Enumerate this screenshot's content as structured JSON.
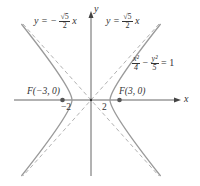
{
  "diagram": {
    "axes": {
      "x_label": "x",
      "y_label": "y"
    },
    "equation": {
      "lhs_term1_num": "x²",
      "lhs_term1_den": "4",
      "minus": "−",
      "lhs_term2_num": "y²",
      "lhs_term2_den": "5",
      "rhs": "= 1"
    },
    "asymptote_left": {
      "prefix": "y = −",
      "num": "√5",
      "den": "2",
      "suffix": "x"
    },
    "asymptote_right": {
      "prefix": "y =",
      "num": "√5",
      "den": "2",
      "suffix": "x"
    },
    "foci": [
      {
        "label": "F(−3, 0)",
        "x": -3,
        "y": 0
      },
      {
        "label": "F(3, 0)",
        "x": 3,
        "y": 0
      }
    ],
    "vertex_ticks": [
      {
        "label": "−2",
        "x": -2
      },
      {
        "label": "2",
        "x": 2
      }
    ],
    "colors": {
      "curve": "#9a9a9a",
      "asymptote": "#a8a8a8",
      "axis": "#444444",
      "focus": "#555555",
      "text": "#333333"
    }
  }
}
